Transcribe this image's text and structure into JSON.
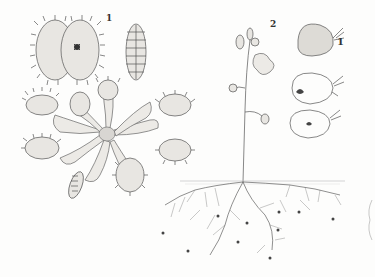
{
  "plate": {
    "figure_labels": {
      "fig1": "1",
      "fig2": "2",
      "bladder_detail": "1"
    },
    "subjects": [
      {
        "id": "fig1",
        "name": "Venus flytrap (Dionaea muscipula)",
        "views": [
          "open trap with insect",
          "closed trap side view",
          "rosette of plant"
        ]
      },
      {
        "id": "fig2",
        "name": "Bladderwort (Utricularia)",
        "views": [
          "flowering stem",
          "bladder exterior",
          "bladder section with prey",
          "bladder section",
          "submerged roots with bladders"
        ]
      }
    ],
    "colors": {
      "paper": "#fdfdfc",
      "ink": "#555555",
      "shade": "#e8e6e2"
    }
  }
}
